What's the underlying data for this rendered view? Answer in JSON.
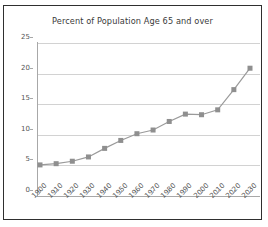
{
  "figure": {
    "frame_border_color": "#2f2f2f",
    "background": "#ffffff"
  },
  "chart_data": {
    "type": "line",
    "title": "Percent of Population Age 65 and over",
    "xlabel": "",
    "ylabel": "",
    "categories": [
      "1900",
      "1910",
      "1920",
      "1930",
      "1940",
      "1950",
      "1960",
      "1970",
      "1980",
      "1990",
      "2000",
      "2010",
      "2020",
      "2030"
    ],
    "values": [
      4.1,
      4.3,
      4.7,
      5.4,
      6.8,
      8.1,
      9.2,
      9.8,
      11.2,
      12.4,
      12.3,
      13.1,
      16.4,
      19.9
    ],
    "series": [
      {
        "name": "Percent of Population Age 65 and over",
        "values": [
          4.1,
          4.3,
          4.7,
          5.4,
          6.8,
          8.1,
          9.2,
          9.8,
          11.2,
          12.4,
          12.3,
          13.1,
          16.4,
          19.9
        ]
      }
    ],
    "ylim": [
      0,
      25
    ],
    "yticks": [
      "0",
      "5",
      "10",
      "15",
      "20",
      "25"
    ],
    "ytick_values": [
      0,
      5,
      10,
      15,
      20,
      25
    ],
    "grid": true,
    "grid_axis": "y",
    "legend": false,
    "legend_position": "none",
    "marker": "square",
    "marker_color": "#8f8f8f",
    "line_color": "#9a9a9a",
    "grid_color": "#d2d2d2",
    "axis_color": "#a8a8a8",
    "tick_label_color": "#555555",
    "title_color": "#3a3a3a",
    "xtick_rotation": -45
  }
}
